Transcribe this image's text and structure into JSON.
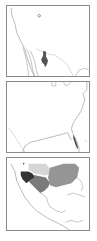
{
  "figure": {
    "panels": [
      {
        "id": "map-west-detail",
        "description": "Western North America outline map with small dark range patch and isolated outlined locality",
        "features": [
          "coastline",
          "state-borders",
          "dark-range-patch",
          "isolated-locality-marker"
        ],
        "colors": {
          "range": "#555555",
          "line": "#8a8a8a"
        }
      },
      {
        "id": "map-southeast-us",
        "description": "Southeastern United States outline map with narrow range along Florida east coast",
        "features": [
          "coastline",
          "dark-range-strip-florida"
        ],
        "colors": {
          "range": "#555555",
          "line": "#8a8a8a"
        }
      },
      {
        "id": "map-north-america-ranges",
        "description": "North and Central America outline map with multiple shaded ranges",
        "features": [
          "coastline",
          "dark-range-southwest",
          "medium-range-south-central",
          "light-range-plains",
          "medium-range-east",
          "locality-marker"
        ],
        "colors": {
          "dark": "#333333",
          "medium": "#7a7a7a",
          "medium_light": "#959595",
          "light": "#d6d6d6",
          "line": "#8a8a8a"
        }
      }
    ]
  }
}
